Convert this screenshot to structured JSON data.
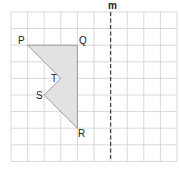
{
  "diagram": {
    "grid": {
      "columns": 10,
      "rows": 9,
      "origin_px": [
        11,
        12
      ],
      "cell_px": 16.6,
      "line_color": "#cfcfcf"
    },
    "mirror_line": {
      "label": "m",
      "grid_x": 6,
      "style": "dashed",
      "color": "#444444"
    },
    "shape": {
      "fill": "#e2e2e2",
      "stroke": "#888888",
      "vertices": [
        {
          "name": "P",
          "grid": [
            1,
            2
          ]
        },
        {
          "name": "Q",
          "grid": [
            4,
            2
          ]
        },
        {
          "name": "R",
          "grid": [
            4,
            7
          ]
        },
        {
          "name": "S",
          "grid": [
            2,
            5
          ]
        },
        {
          "name": "T",
          "grid": [
            3,
            4
          ]
        }
      ]
    },
    "labels": {
      "P": "P",
      "Q": "Q",
      "R": "R",
      "S": "S",
      "T": "T",
      "m": "m"
    }
  }
}
